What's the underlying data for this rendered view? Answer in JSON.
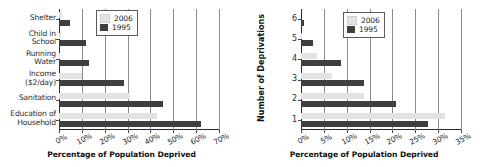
{
  "chart_data": [
    {
      "type": "bar",
      "orientation": "horizontal",
      "title": "",
      "xlabel": "Percentage of Population Deprived",
      "ylabel": "",
      "xlim": [
        0,
        70
      ],
      "xticks": [
        "0%",
        "10%",
        "20%",
        "30%",
        "40%",
        "50%",
        "60%",
        "70%"
      ],
      "xtick_values": [
        0,
        10,
        20,
        30,
        40,
        50,
        60,
        70
      ],
      "grid": true,
      "legend_position": "upper right",
      "categories": [
        "Shelter",
        "Child in\nSchool",
        "Running\nWater",
        "Income\n($2/day)",
        "Sanitation",
        "Education of\nHousehold"
      ],
      "series": [
        {
          "name": "2006",
          "color": "#e3e3e3",
          "values": [
            1.5,
            1.0,
            0.5,
            10.0,
            31.0,
            43.0
          ]
        },
        {
          "name": "1995",
          "color": "#3f3f3f",
          "values": [
            5.0,
            12.0,
            13.0,
            28.5,
            45.5,
            62.0
          ]
        }
      ]
    },
    {
      "type": "bar",
      "orientation": "horizontal",
      "title": "",
      "xlabel": "Percentage of Population Deprived",
      "ylabel": "Number of Deprivations",
      "xlim": [
        0,
        35
      ],
      "xticks": [
        "0%",
        "5%",
        "10%",
        "15%",
        "20%",
        "25%",
        "30%",
        "35%"
      ],
      "xtick_values": [
        0,
        5,
        10,
        15,
        20,
        25,
        30,
        35
      ],
      "grid": true,
      "legend_position": "upper right",
      "categories": [
        "6",
        "5",
        "4",
        "3",
        "2",
        "1"
      ],
      "series": [
        {
          "name": "2006",
          "color": "#e3e3e3",
          "values": [
            0.0,
            0.3,
            3.5,
            6.7,
            13.8,
            31.5
          ]
        },
        {
          "name": "1995",
          "color": "#3f3f3f",
          "values": [
            0.7,
            2.7,
            8.7,
            13.8,
            20.7,
            27.7
          ]
        }
      ]
    }
  ],
  "left_chart": {
    "name": "deprivation-by-indicator-chart",
    "xaxis_title": "Percentage of Population Deprived",
    "legend": [
      {
        "label": "2006",
        "color": "#e3e3e3"
      },
      {
        "label": "1995",
        "color": "#3f3f3f"
      }
    ]
  },
  "right_chart": {
    "name": "deprivation-count-chart",
    "xaxis_title": "Percentage of Population Deprived",
    "yaxis_title": "Number of Deprivations",
    "legend": [
      {
        "label": "2006",
        "color": "#e3e3e3"
      },
      {
        "label": "1995",
        "color": "#3f3f3f"
      }
    ]
  }
}
